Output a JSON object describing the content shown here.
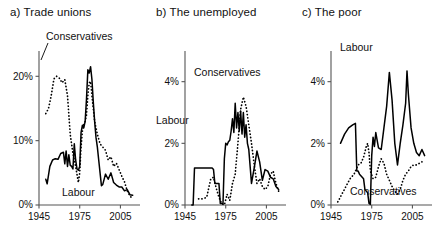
{
  "figure": {
    "series_names": {
      "labour": "Labour",
      "conservatives": "Conservatives"
    },
    "xaxis_ticks": [
      "1945",
      "1975",
      "2005"
    ]
  },
  "panels": {
    "a": {
      "title": "a) Trade unions",
      "label_conservatives": "Conservatives",
      "label_labour": "Labour",
      "yticks": [
        "0%",
        "10%",
        "20%"
      ]
    },
    "b": {
      "title": "b) The unemployed",
      "label_conservatives": "Conservatives",
      "label_labour": "Labour",
      "yticks": [
        "0%",
        "2%",
        "4%"
      ]
    },
    "c": {
      "title": "c) The poor",
      "label_conservatives": "Conservatives",
      "label_labour": "Labour",
      "yticks": [
        "0%",
        "2%",
        "4%"
      ]
    }
  },
  "chart_data": [
    {
      "type": "line",
      "title": "a) Trade unions",
      "xlabel": "",
      "ylabel": "",
      "xlim": [
        1945,
        2015
      ],
      "ylim": [
        0,
        23
      ],
      "xticks": [
        1945,
        1975,
        2005
      ],
      "yticks": [
        0,
        10,
        20
      ],
      "ytick_labels": [
        "0%",
        "10%",
        "20%"
      ],
      "grid": false,
      "legend": "inline annotations",
      "series": [
        {
          "name": "Labour",
          "style": "solid",
          "x": [
            1950,
            1951,
            1953,
            1955,
            1957,
            1959,
            1961,
            1963,
            1964,
            1965,
            1966,
            1967,
            1968,
            1969,
            1970,
            1971,
            1972,
            1973,
            1974,
            1975,
            1976,
            1977,
            1978,
            1979,
            1980,
            1981,
            1982,
            1983,
            1984,
            1985,
            1986,
            1987,
            1988,
            1989,
            1990,
            1991,
            1992,
            1994,
            1996,
            1998,
            2000,
            2002,
            2004,
            2006,
            2008,
            2010,
            2012,
            2014
          ],
          "y": [
            4.0,
            3.3,
            6.0,
            7.0,
            7.2,
            7.1,
            8.0,
            8.2,
            6.4,
            8.4,
            6.0,
            7.8,
            6.2,
            6.0,
            5.6,
            9.5,
            7.0,
            5.6,
            5.4,
            6.0,
            11.3,
            12.4,
            12.0,
            13.0,
            16.5,
            21.0,
            20.5,
            21.5,
            19.5,
            16.0,
            13.0,
            10.5,
            9.0,
            7.0,
            5.0,
            3.0,
            3.2,
            4.8,
            4.0,
            5.0,
            3.5,
            3.1,
            2.8,
            2.8,
            2.2,
            2.4,
            1.6,
            1.5
          ]
        },
        {
          "name": "Conservatives",
          "style": "dotted",
          "x": [
            1950,
            1952,
            1954,
            1956,
            1958,
            1960,
            1962,
            1964,
            1966,
            1968,
            1970,
            1972,
            1974,
            1975,
            1976,
            1977,
            1978,
            1979,
            1980,
            1981,
            1982,
            1983,
            1984,
            1986,
            1988,
            1990,
            1992,
            1994,
            1996,
            1998,
            2000,
            2002,
            2004,
            2006,
            2008,
            2010,
            2012,
            2014
          ],
          "y": [
            14.2,
            15.0,
            17.0,
            19.6,
            20.0,
            19.7,
            19.0,
            19.5,
            17.0,
            11.0,
            8.0,
            6.0,
            3.5,
            5.0,
            9.0,
            11.5,
            12.5,
            13.0,
            14.0,
            17.0,
            19.0,
            19.2,
            17.0,
            13.0,
            11.0,
            9.5,
            9.0,
            8.5,
            7.0,
            7.5,
            6.0,
            6.5,
            5.5,
            4.5,
            3.6,
            2.2,
            1.4,
            1.0
          ]
        }
      ]
    },
    {
      "type": "line",
      "title": "b) The unemployed",
      "xlabel": "",
      "ylabel": "",
      "xlim": [
        1945,
        2015
      ],
      "ylim": [
        0,
        4.8
      ],
      "xticks": [
        1945,
        1975,
        2005
      ],
      "yticks": [
        0,
        2,
        4
      ],
      "ytick_labels": [
        "0%",
        "2%",
        "4%"
      ],
      "grid": false,
      "legend": "inline annotations",
      "series": [
        {
          "name": "Labour",
          "style": "solid",
          "x": [
            1950,
            1951,
            1952,
            1955,
            1958,
            1961,
            1963,
            1965,
            1966,
            1967,
            1968,
            1969,
            1970,
            1971,
            1972,
            1973,
            1974,
            1975,
            1976,
            1977,
            1978,
            1979,
            1980,
            1981,
            1982,
            1983,
            1984,
            1985,
            1986,
            1987,
            1988,
            1989,
            1990,
            1991,
            1992,
            1994,
            1996,
            1998,
            2000,
            2002,
            2004,
            2006,
            2008,
            2010,
            2012,
            2014
          ],
          "y": [
            0.0,
            0.0,
            1.2,
            1.2,
            1.2,
            1.2,
            1.2,
            1.2,
            1.15,
            0.7,
            0.7,
            0.7,
            0.7,
            0.05,
            0.05,
            0.05,
            1.5,
            2.0,
            1.95,
            2.05,
            2.1,
            2.4,
            2.8,
            2.35,
            3.3,
            2.5,
            3.0,
            2.4,
            3.05,
            2.3,
            3.0,
            2.2,
            2.6,
            2.0,
            1.8,
            0.7,
            1.2,
            1.75,
            1.4,
            0.8,
            1.15,
            1.1,
            0.9,
            0.85,
            0.6,
            0.5
          ]
        },
        {
          "name": "Conservatives",
          "style": "dotted",
          "x": [
            1955,
            1958,
            1961,
            1964,
            1966,
            1968,
            1970,
            1972,
            1974,
            1976,
            1978,
            1980,
            1982,
            1984,
            1986,
            1988,
            1990,
            1992,
            1994,
            1996,
            1998,
            2000,
            2002,
            2004,
            2006,
            2008,
            2010,
            2012,
            2014
          ],
          "y": [
            0.2,
            0.2,
            0.25,
            0.85,
            0.9,
            0.55,
            0.25,
            0.05,
            0.0,
            0.35,
            0.15,
            0.7,
            1.0,
            2.0,
            3.1,
            3.5,
            3.2,
            2.6,
            2.0,
            1.3,
            0.7,
            0.85,
            0.6,
            0.5,
            0.6,
            1.0,
            1.1,
            0.7,
            0.45
          ]
        }
      ]
    },
    {
      "type": "line",
      "title": "c) The poor",
      "xlabel": "",
      "ylabel": "",
      "xlim": [
        1945,
        2015
      ],
      "ylim": [
        0,
        4.8
      ],
      "xticks": [
        1945,
        1975,
        2005
      ],
      "yticks": [
        0,
        2,
        4
      ],
      "ytick_labels": [
        "0%",
        "2%",
        "4%"
      ],
      "grid": false,
      "legend": "inline annotations",
      "series": [
        {
          "name": "Labour",
          "style": "solid",
          "x": [
            1952,
            1955,
            1958,
            1961,
            1963,
            1964,
            1965,
            1966,
            1967,
            1968,
            1969,
            1970,
            1971,
            1972,
            1973,
            1974,
            1975,
            1976,
            1977,
            1978,
            1980,
            1982,
            1984,
            1986,
            1988,
            1990,
            1992,
            1994,
            1996,
            1998,
            2000,
            2001,
            2002,
            2004,
            2006,
            2008,
            2010,
            2012,
            2014
          ],
          "y": [
            2.0,
            2.3,
            2.5,
            2.6,
            2.65,
            1.1,
            1.1,
            1.0,
            0.95,
            0.9,
            0.85,
            0.5,
            0.45,
            0.4,
            0.05,
            0.02,
            1.6,
            2.2,
            1.9,
            2.35,
            1.85,
            1.8,
            2.5,
            3.2,
            4.3,
            3.4,
            2.0,
            1.3,
            2.0,
            2.6,
            3.3,
            4.35,
            3.6,
            2.5,
            2.0,
            1.7,
            1.6,
            1.8,
            1.6
          ]
        },
        {
          "name": "Conservatives",
          "style": "dotted",
          "x": [
            1950,
            1953,
            1956,
            1959,
            1962,
            1965,
            1967,
            1969,
            1971,
            1972,
            1973,
            1974,
            1976,
            1978,
            1980,
            1982,
            1984,
            1986,
            1988,
            1990,
            1992,
            1994,
            1996,
            1998,
            2000,
            2002,
            2004,
            2006,
            2008,
            2010,
            2012,
            2014
          ],
          "y": [
            0.1,
            0.35,
            0.6,
            0.85,
            1.0,
            1.3,
            1.35,
            1.55,
            1.9,
            2.0,
            1.7,
            1.1,
            0.85,
            0.9,
            1.25,
            1.5,
            1.35,
            1.0,
            0.8,
            0.6,
            0.45,
            0.35,
            0.5,
            0.8,
            1.0,
            1.1,
            1.25,
            1.3,
            1.3,
            1.35,
            1.4,
            1.35
          ]
        }
      ]
    }
  ]
}
